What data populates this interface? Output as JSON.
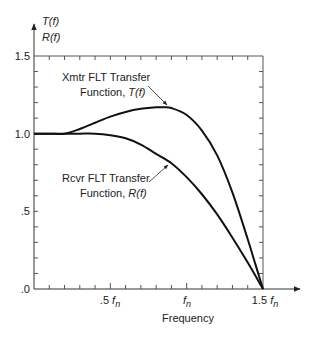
{
  "chart_data": {
    "type": "line",
    "title": "",
    "xlabel": "Frequency",
    "ylabel_lines": [
      "T(f)",
      "R(f)"
    ],
    "x_unit": "f_n",
    "xlim": [
      0,
      1.5
    ],
    "ylim": [
      0,
      1.5
    ],
    "x_ticks": [
      {
        "value": 0.5,
        "label": ".5",
        "unit": "fn"
      },
      {
        "value": 1.0,
        "label": "",
        "unit": "fn"
      },
      {
        "value": 1.5,
        "label": "1.5",
        "unit": "fn"
      }
    ],
    "x_minor_step": 0.1,
    "y_ticks": [
      {
        "value": 0.0,
        "label": ".0"
      },
      {
        "value": 0.5,
        "label": ".5"
      },
      {
        "value": 1.0,
        "label": "1.0"
      },
      {
        "value": 1.5,
        "label": "1.5"
      }
    ],
    "y_minor_step": 0.1,
    "grid": false,
    "series": [
      {
        "name": "Xmtr FLT Transfer Function, T(f)",
        "x": [
          0,
          0.1,
          0.2,
          0.3,
          0.4,
          0.5,
          0.6,
          0.7,
          0.8,
          0.85,
          0.9,
          1.0,
          1.1,
          1.2,
          1.3,
          1.4,
          1.45,
          1.5
        ],
        "values": [
          1.0,
          1.0,
          1.0,
          1.03,
          1.07,
          1.11,
          1.14,
          1.16,
          1.17,
          1.17,
          1.165,
          1.12,
          1.02,
          0.86,
          0.62,
          0.32,
          0.16,
          0.0
        ]
      },
      {
        "name": "Rcvr FLT Transfer Function, R(f)",
        "x": [
          0,
          0.1,
          0.2,
          0.3,
          0.4,
          0.5,
          0.6,
          0.7,
          0.8,
          0.9,
          1.0,
          1.1,
          1.2,
          1.3,
          1.4,
          1.5
        ],
        "values": [
          1.0,
          1.0,
          1.0,
          1.0,
          1.0,
          0.99,
          0.97,
          0.93,
          0.87,
          0.81,
          0.72,
          0.61,
          0.48,
          0.33,
          0.17,
          0.0
        ]
      }
    ],
    "annotations": [
      {
        "line1": "Xmtr FLT Transfer",
        "line2_prefix": "Function, ",
        "line2_symbol": "T(f)"
      },
      {
        "line1": "Rcvr FLT Transfer",
        "line2_prefix": "Function, ",
        "line2_symbol": "R(f)"
      }
    ],
    "legend": "none (inline annotations with arrows)"
  },
  "labels": {
    "y_axis_top": "T(f)",
    "y_axis_bottom": "R(f)",
    "y_15": "1.5",
    "y_10": "1.0",
    "y_05": ".5",
    "y_00": ".0",
    "x_05_num": ".5",
    "x_fn": "f",
    "x_fn_sub": "n",
    "x_15_num": "1.5",
    "x_title": "Frequency",
    "t_line1": "Xmtr FLT Transfer",
    "t_line2": "Function, ",
    "t_sym": "T(f)",
    "r_line1": "Rcvr FLT Transfer",
    "r_line2": "Function, ",
    "r_sym": "R(f)"
  }
}
